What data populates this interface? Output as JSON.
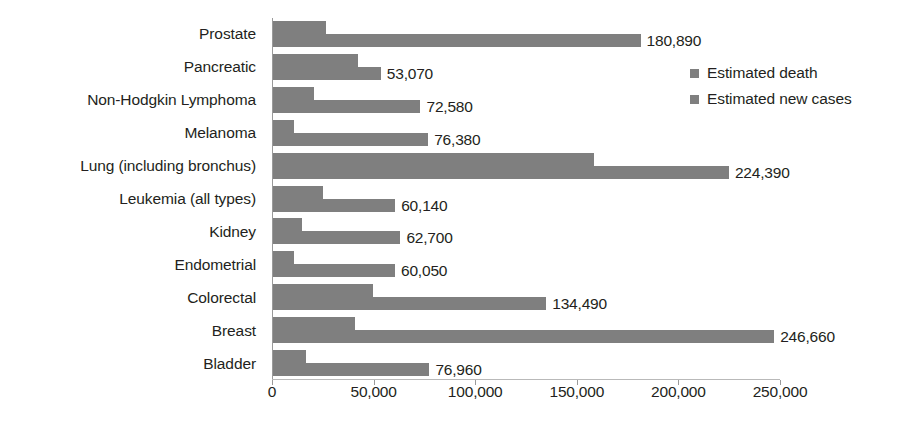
{
  "chart_data": {
    "type": "bar",
    "orientation": "horizontal",
    "title": "",
    "xlabel": "",
    "ylabel": "",
    "xlim": [
      0,
      250000
    ],
    "xticks": [
      0,
      50000,
      100000,
      150000,
      200000,
      250000
    ],
    "xtick_labels": [
      "0",
      "50,000",
      "100,000",
      "150,000",
      "200,000",
      "250,000"
    ],
    "grid": false,
    "legend_position": "upper-right",
    "categories": [
      "Prostate",
      "Pancreatic",
      "Non-Hodgkin Lymphoma",
      "Melanoma",
      "Lung (including bronchus)",
      "Leukemia (all types)",
      "Kidney",
      "Endometrial",
      "Colorectal",
      "Breast",
      "Bladder"
    ],
    "series": [
      {
        "name": "Estimated death",
        "color": "#7f7f7f",
        "values": [
          26120,
          41780,
          20150,
          10130,
          158080,
          24400,
          14240,
          10470,
          49190,
          40450,
          16390
        ],
        "labels": [
          "",
          "",
          "",
          "",
          "",
          "",
          "",
          "",
          "",
          "",
          ""
        ]
      },
      {
        "name": "Estimated new cases",
        "color": "#7f7f7f",
        "values": [
          180890,
          53070,
          72580,
          76380,
          224390,
          60140,
          62700,
          60050,
          134490,
          246660,
          76960
        ],
        "labels": [
          "180,890",
          "53,070",
          "72,580",
          "76,380",
          "224,390",
          "60,140",
          "62,700",
          "60,050",
          "134,490",
          "246,660",
          "76,960"
        ]
      }
    ]
  },
  "legend": {
    "items": [
      {
        "label": "Estimated death",
        "color": "#7f7f7f"
      },
      {
        "label": "Estimated new cases",
        "color": "#7f7f7f"
      }
    ]
  },
  "colors": {
    "bar": "#7f7f7f",
    "axis": "#9a9a9a",
    "text": "#231f20",
    "background": "#ffffff"
  }
}
